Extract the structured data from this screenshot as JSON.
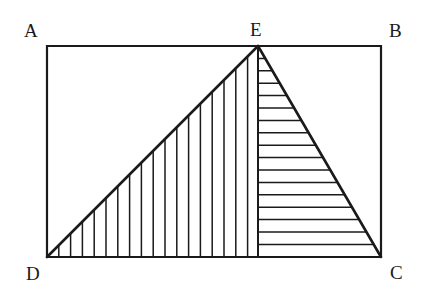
{
  "figure": {
    "kind": "geometry-diagram",
    "canvas": {
      "width": 422,
      "height": 300,
      "background": "#ffffff"
    },
    "ink_color": "#1a1a1a",
    "labels": {
      "A": "A",
      "B": "B",
      "C": "C",
      "D": "D",
      "E": "E"
    },
    "points": {
      "A": {
        "x": 47,
        "y": 46,
        "label": "A",
        "label_x": 24,
        "label_y": 21
      },
      "B": {
        "x": 381,
        "y": 46,
        "label": "B",
        "label_x": 389,
        "label_y": 21
      },
      "C": {
        "x": 381,
        "y": 257,
        "label": "C",
        "label_x": 390,
        "label_y": 263
      },
      "D": {
        "x": 47,
        "y": 257,
        "label": "D",
        "label_x": 26,
        "label_y": 264
      },
      "E": {
        "x": 258,
        "y": 46,
        "label": "E",
        "label_x": 250,
        "label_y": 20
      },
      "F": {
        "x": 258,
        "y": 257,
        "label": "",
        "label_x": 0,
        "label_y": 0
      }
    },
    "rectangle": {
      "name": "ABCD",
      "vertices": [
        "A",
        "B",
        "C",
        "D"
      ],
      "stroke_width": 2.2
    },
    "segments": [
      {
        "name": "DE",
        "from": "D",
        "to": "E",
        "stroke_width": 2.6
      },
      {
        "name": "EC",
        "from": "E",
        "to": "C",
        "stroke_width": 2.6
      },
      {
        "name": "EF",
        "from": "E",
        "to": "F",
        "stroke_width": 2.0
      }
    ],
    "triangles": [
      {
        "name": "DEF",
        "vertices": [
          "D",
          "E",
          "F"
        ],
        "hatch": "vertical",
        "hatch_spacing": 11.8,
        "hatch_stroke_width": 1.5,
        "hatch_count": 17
      },
      {
        "name": "EFC",
        "vertices": [
          "E",
          "F",
          "C"
        ],
        "hatch": "horizontal",
        "hatch_spacing": 12.4,
        "hatch_stroke_width": 1.5,
        "hatch_count": 16
      }
    ]
  }
}
